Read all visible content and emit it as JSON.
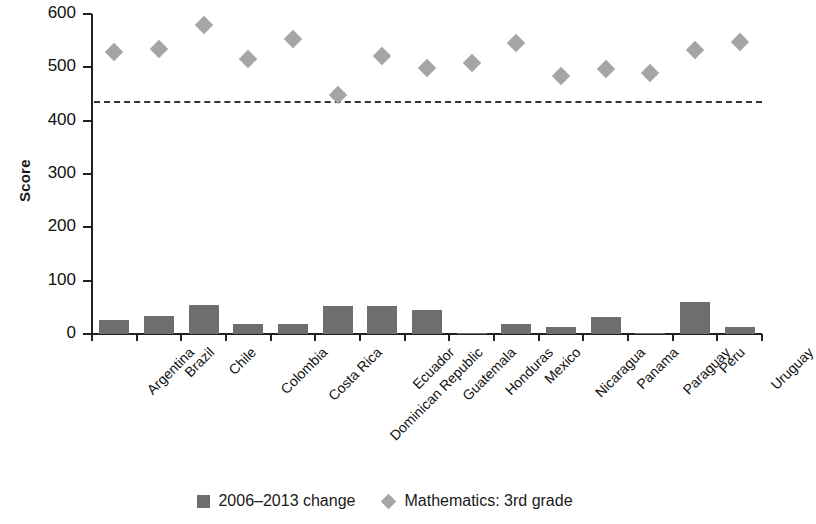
{
  "chart_data": {
    "type": "bar",
    "title": "",
    "xlabel": "",
    "ylabel": "Score",
    "ylim": [
      0,
      600
    ],
    "yticks": [
      0,
      100,
      200,
      300,
      400,
      500,
      600
    ],
    "grid": false,
    "legend_position": "bottom",
    "categories": [
      "Argentina",
      "Brazil",
      "Chile",
      "Colombia",
      "Costa Rica",
      "Dominican Republic",
      "Ecuador",
      "Guatemala",
      "Honduras",
      "Mexico",
      "Nicaragua",
      "Panama",
      "Paraguay",
      "Peru",
      "Uruguay"
    ],
    "series": [
      {
        "name": "2006–2013 change",
        "type": "bar",
        "color": "#6e6e6e",
        "values": [
          26,
          34,
          55,
          19,
          19,
          52,
          52,
          45,
          1,
          18,
          13,
          32,
          2,
          60,
          14
        ]
      },
      {
        "name": "Mathematics: 3rd grade",
        "type": "scatter",
        "marker": "diamond",
        "color": "#a5a5a5",
        "values": [
          529,
          534,
          579,
          516,
          553,
          448,
          521,
          499,
          508,
          546,
          484,
          497,
          490,
          532,
          548
        ]
      }
    ],
    "reference_line": {
      "name": "regional-average-reference",
      "value": 437,
      "style": "dashed",
      "color": "#333333"
    }
  },
  "axes": {
    "y_title": "Score",
    "y_tick_labels": [
      "600",
      "500",
      "400",
      "300",
      "200",
      "100",
      "0"
    ]
  },
  "legend": {
    "items": [
      {
        "label": "2006–2013 change",
        "marker": "square-icon"
      },
      {
        "label": "Mathematics: 3rd grade",
        "marker": "diamond-icon"
      }
    ]
  }
}
